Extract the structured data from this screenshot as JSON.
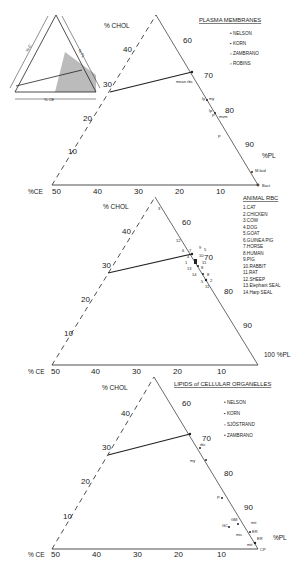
{
  "figure": {
    "inset": {
      "label_c": "% C",
      "label_pl": "% PL",
      "label_ce": "% CE"
    },
    "panels": [
      {
        "title": "PLASMA MEMBRANES",
        "axis_chol": "% CHOL",
        "axis_ce": "%CE",
        "axis_pl": "%PL",
        "legend": [
          "NELSON",
          "KORN",
          "ZAMBRANO",
          "ROBINS"
        ],
        "chol_ticks": [
          "10",
          "20",
          "30",
          "40"
        ],
        "pl_ticks": [
          "60",
          "70",
          "80",
          "90"
        ],
        "ce_ticks": [
          "50",
          "40",
          "30",
          "20",
          "10"
        ],
        "point_labels": [
          "mean rbc",
          "ly",
          "my",
          "lp",
          "P",
          "mvm",
          "P",
          "M.laid",
          "Bact"
        ]
      },
      {
        "title": "ANIMAL RBC",
        "axis_chol": "% CHOL",
        "axis_ce": "% CE",
        "axis_pl": "100 %PL",
        "legend": [
          "1.CAT",
          "2.CHICKEN",
          "3.COW",
          "4.DOG",
          "5.GOAT",
          "6.GUINEA PIG",
          "7.HORSE",
          "8.HUMAN",
          "9.PIG",
          "10.RABBIT",
          "11.RAT",
          "12.SHEEP",
          "13.Elephant SEAL",
          "14.Harp SEAL"
        ],
        "chol_ticks": [
          "10",
          "20",
          "30",
          "40"
        ],
        "pl_ticks": [
          "60",
          "70",
          "80",
          "90"
        ],
        "ce_ticks": [
          "50",
          "40",
          "30",
          "20",
          "10"
        ],
        "point_labels": [
          "3",
          "12",
          "6",
          "7",
          "4",
          "9",
          "5",
          "1",
          "10",
          "11",
          "8",
          "13",
          "14",
          "5",
          "2",
          "11",
          "8"
        ]
      },
      {
        "title": "LIPIDS of CELLULAR ORGANELLES",
        "axis_chol": "% CHOL",
        "axis_ce": "% CE",
        "axis_pl": "%PL",
        "legend": [
          "NELSON",
          "KORN",
          "SJÖSTRAND",
          "ZAMBRANO"
        ],
        "chol_ticks": [
          "10",
          "20",
          "30",
          "40"
        ],
        "pl_ticks": [
          "60",
          "70",
          "80",
          "90"
        ],
        "ce_ticks": [
          "50",
          "40",
          "30",
          "20",
          "10"
        ],
        "point_labels": [
          "rbc",
          "my",
          "P",
          "GM",
          "GC",
          "mit",
          "mic",
          "ER",
          "mit",
          "ER",
          "CP"
        ]
      }
    ]
  }
}
